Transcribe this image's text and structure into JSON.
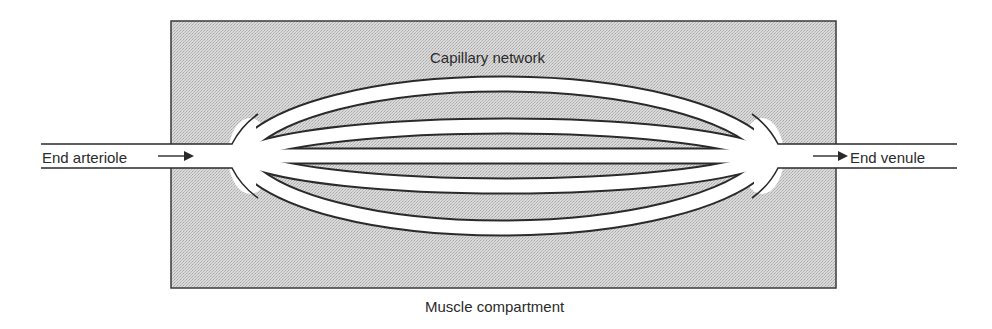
{
  "diagram": {
    "labels": {
      "capillary_network": "Capillary network",
      "muscle_compartment": "Muscle compartment",
      "end_arteriole": "End arteriole",
      "end_venule": "End venule"
    },
    "icons": {
      "arteriole_arrow": "arrow-right",
      "venule_arrow": "arrow-right"
    },
    "colors": {
      "compartment_fill": "#cfcfcf",
      "stroke": "#2a2a2a",
      "vessel_fill": "#ffffff",
      "background": "#ffffff"
    },
    "vessels": {
      "capillary_count": 5,
      "flow_direction": "left-to-right"
    }
  }
}
